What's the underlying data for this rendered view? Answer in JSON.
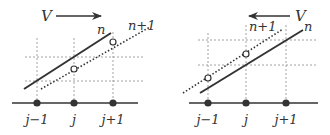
{
  "figure": {
    "colors": {
      "ink": "#333333",
      "grid": "#8a8a8a",
      "background": "#ffffff"
    },
    "panels": [
      {
        "id": "left",
        "velocity_label": "V",
        "velocity_direction": "right",
        "line_n_label": "n",
        "line_n1_label": "n+1",
        "node_labels": [
          "j−1",
          "j",
          "j+1"
        ]
      },
      {
        "id": "right",
        "velocity_label": "V",
        "velocity_direction": "left",
        "line_n_label": "n",
        "line_n1_label": "n+1",
        "node_labels": [
          "j−1",
          "j",
          "j+1"
        ]
      }
    ]
  }
}
